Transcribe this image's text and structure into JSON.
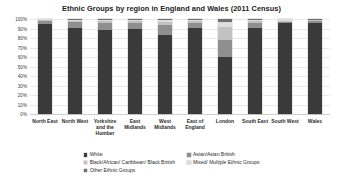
{
  "chart_data": {
    "type": "bar",
    "subtype": "stacked-bar-100-percent",
    "title": "Ethnic Groups by region in England and Wales (2011 Census)",
    "xlabel": "",
    "ylabel": "",
    "ylim": [
      0,
      100
    ],
    "ytick_labels": [
      "100%",
      "90%",
      "80%",
      "70%",
      "60%",
      "50%",
      "40%",
      "30%",
      "20%",
      "10%",
      "0%"
    ],
    "ytick_values": [
      100,
      90,
      80,
      70,
      60,
      50,
      40,
      30,
      20,
      10,
      0
    ],
    "grid": true,
    "legend_position": "bottom",
    "categories": [
      "North East",
      "North West",
      "Yorkshire and the Humber",
      "East Midlands",
      "West Midlands",
      "East of England",
      "London",
      "South East",
      "South West",
      "Wales"
    ],
    "series": [
      {
        "name": "White",
        "color": "#3a3a3a",
        "values": [
          93.6,
          90.2,
          88.8,
          89.3,
          82.7,
          90.8,
          59.8,
          90.7,
          95.4,
          95.6
        ]
      },
      {
        "name": "Asian/Asian British",
        "color": "#8f8f8f",
        "values": [
          2.9,
          6.2,
          7.3,
          6.5,
          10.8,
          4.8,
          18.5,
          5.2,
          1.9,
          2.3
        ]
      },
      {
        "name": "Black/African/Caribbean/Black British",
        "color": "#c2c2c2",
        "values": [
          0.5,
          1.4,
          1.5,
          1.8,
          3.3,
          2.0,
          13.3,
          1.6,
          0.9,
          0.6
        ]
      },
      {
        "name": "Mixed/Multiple Ethnic Groups",
        "color": "#dddddd",
        "values": [
          0.9,
          1.6,
          1.7,
          1.9,
          2.4,
          2.0,
          5.0,
          1.9,
          1.4,
          1.0
        ]
      },
      {
        "name": "Other Ethnic Groups",
        "color": "#6e6e6e",
        "values": [
          0.4,
          0.6,
          0.7,
          0.5,
          0.8,
          0.6,
          3.4,
          0.6,
          0.4,
          0.5
        ]
      }
    ]
  },
  "legend": {
    "column_left": [
      "White",
      "Black/African/ Caribbean/ Black British",
      "Other Ethnic Groups"
    ],
    "column_right": [
      "Asian/Asian British",
      "Mixed/ Multiple Ethnic Groups"
    ]
  }
}
